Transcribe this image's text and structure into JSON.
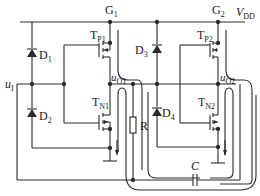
{
  "diagram": {
    "type": "circuit-schematic",
    "colors": {
      "wire": "#2a2a2a",
      "background": "#ffffff"
    },
    "labels": {
      "g1": "G",
      "g1_sub": "1",
      "g2": "G",
      "g2_sub": "2",
      "vdd": "V",
      "vdd_sub": "DD",
      "d1": "D",
      "d1_sub": "1",
      "d2": "D",
      "d2_sub": "2",
      "d3": "D",
      "d3_sub": "3",
      "d4": "D",
      "d4_sub": "4",
      "tp1": "T",
      "tp1_sub": "P1",
      "tn1": "T",
      "tn1_sub": "N1",
      "tp2": "T",
      "tp2_sub": "P2",
      "tn2": "T",
      "tn2_sub": "N2",
      "ui": "u",
      "ui_sub": "I",
      "uo1": "u",
      "uo1_sub": "O1",
      "uo2": "u",
      "uo2_sub": "O2",
      "r": "R",
      "c": "C"
    },
    "components": [
      {
        "id": "D1",
        "kind": "diode"
      },
      {
        "id": "D2",
        "kind": "diode"
      },
      {
        "id": "D3",
        "kind": "diode"
      },
      {
        "id": "D4",
        "kind": "diode"
      },
      {
        "id": "TP1",
        "kind": "pmos"
      },
      {
        "id": "TN1",
        "kind": "nmos"
      },
      {
        "id": "TP2",
        "kind": "pmos"
      },
      {
        "id": "TN2",
        "kind": "nmos"
      },
      {
        "id": "R",
        "kind": "resistor"
      },
      {
        "id": "C",
        "kind": "capacitor"
      }
    ]
  }
}
